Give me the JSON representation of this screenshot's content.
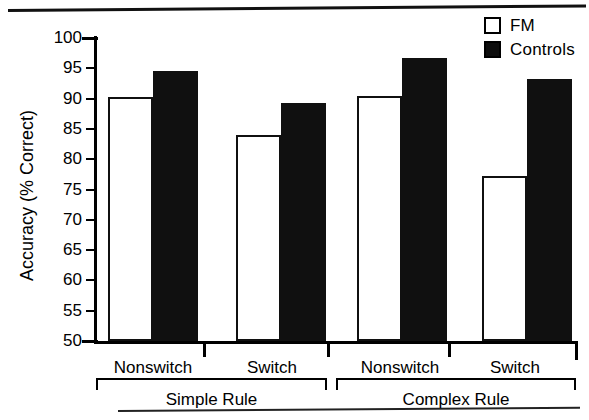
{
  "figure": {
    "y_axis_title": "Accuracy (% Correct)",
    "y_ticks": [
      "100",
      "95",
      "90",
      "85",
      "80",
      "75",
      "70",
      "65",
      "60",
      "55",
      "50"
    ],
    "x_categories": [
      "Nonswitch",
      "Switch",
      "Nonswitch",
      "Switch"
    ],
    "x_groups": [
      "Simple Rule",
      "Complex Rule"
    ],
    "legend": [
      {
        "label": "FM",
        "swatch": "open-square-icon",
        "color": "#ffffff"
      },
      {
        "label": "Controls",
        "swatch": "filled-square-icon",
        "color": "#101010"
      }
    ]
  },
  "chart_data": {
    "type": "bar",
    "title": "",
    "xlabel": "",
    "ylabel": "Accuracy (% Correct)",
    "ylim": [
      50,
      100
    ],
    "ytick_step": 5,
    "grid": false,
    "legend_position": "top-right",
    "categories": [
      "Nonswitch",
      "Switch",
      "Nonswitch",
      "Switch"
    ],
    "group_labels": [
      "Simple Rule",
      "Simple Rule",
      "Complex Rule",
      "Complex Rule"
    ],
    "series": [
      {
        "name": "FM",
        "color": "#ffffff",
        "values": [
          90.3,
          84.0,
          90.4,
          77.2
        ]
      },
      {
        "name": "Controls",
        "color": "#101010",
        "values": [
          94.5,
          89.2,
          96.7,
          93.3
        ]
      }
    ],
    "annotations": []
  }
}
